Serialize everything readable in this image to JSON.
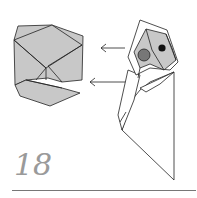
{
  "step": {
    "number": "18"
  },
  "colors": {
    "paper_fill": "#c8c8c8",
    "paper_white": "#ffffff",
    "line": "#222222",
    "eye_gray": "#777777",
    "eye_black": "#111111",
    "step_number": "#9a9a9a",
    "rule": "#777777"
  },
  "figures": [
    {
      "name": "head-detail-view",
      "description": "Enlarged view of folded head (gray faces)"
    },
    {
      "name": "bird-figure",
      "description": "Folded model with gray head, gray eye and black eye"
    }
  ],
  "arrows": [
    {
      "name": "upper-view-arrow",
      "direction": "left"
    },
    {
      "name": "lower-view-arrow",
      "direction": "left"
    }
  ]
}
